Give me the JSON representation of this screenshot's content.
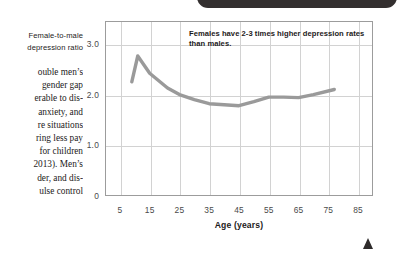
{
  "page": {
    "banner_label": "",
    "corner_marker": "triangle-marker"
  },
  "text_column": {
    "axis_title_line1": "Female-to-male",
    "axis_title_line2": "depression ratio",
    "body_lines": [
      "ouble men’s",
      "gender gap",
      "erable to dis-",
      "anxiety, and",
      "re situations",
      "ring less pay",
      "for children",
      "2013). Men’s",
      "der, and dis-",
      "ulse control"
    ]
  },
  "chart_data": {
    "type": "line",
    "title": "",
    "xlabel": "Age (years)",
    "ylabel": "Female-to-male depression ratio",
    "annotation": "Females have 2-3 times higher depression rates than males.",
    "xlim": [
      0,
      90
    ],
    "ylim": [
      0,
      3.45
    ],
    "grid": true,
    "legend": "none",
    "line_color": "#9a9a9a",
    "xticks": [
      5,
      15,
      25,
      35,
      45,
      55,
      65,
      75,
      85
    ],
    "xtick_labels": [
      "5",
      "15",
      "25",
      "35",
      "45",
      "55",
      "65",
      "75",
      "85"
    ],
    "yticks": [
      0,
      1.0,
      2.0,
      3.0
    ],
    "ytick_labels": [
      "0",
      "1.0",
      "2.0",
      "3.0"
    ],
    "series": [
      {
        "name": "Female-to-male depression ratio",
        "x": [
          9,
          11,
          15,
          21,
          25,
          30,
          35,
          40,
          45,
          50,
          55,
          60,
          65,
          70,
          77
        ],
        "values": [
          2.25,
          2.76,
          2.42,
          2.13,
          2.0,
          1.9,
          1.82,
          1.8,
          1.78,
          1.86,
          1.95,
          1.95,
          1.94,
          2.0,
          2.1
        ]
      }
    ]
  }
}
